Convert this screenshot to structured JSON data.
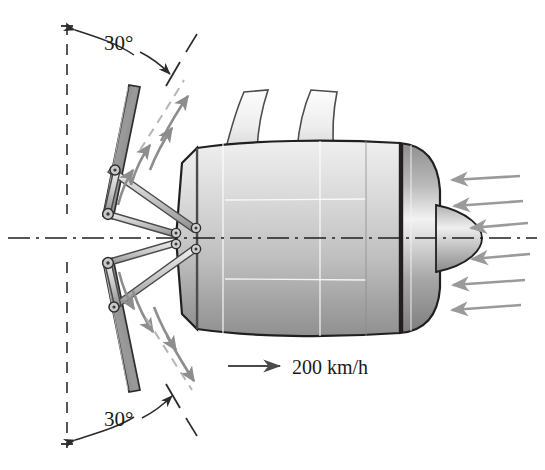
{
  "figure": {
    "type": "engineering-diagram",
    "width": 545,
    "height": 470,
    "background": "#ffffff"
  },
  "annotations": {
    "angle_top": "30°",
    "angle_bottom": "30°",
    "velocity": "200 km/h"
  },
  "colors": {
    "outline": "#231f20",
    "body_light": "#ececec",
    "body_mid": "#c4c4c4",
    "body_dark": "#8f8f8f",
    "bucket": "#8a8a8a",
    "bucket_edge": "#3a3a3a",
    "flow_arrow": "#8d8d8d",
    "inlet_arrow": "#9a9a9a",
    "dim_line": "#2b2b2b",
    "center_line": "#1f1f1f",
    "link": "#d0d0d0",
    "link_edge": "#4a4a4a"
  },
  "geometry": {
    "centerline_y": 238,
    "vertical_ref_x": 67,
    "reverser_angle_deg": 30,
    "pivot_upper": [
      105,
      212
    ],
    "pivot_lower": [
      105,
      265
    ],
    "inlet_arrow_count": 6,
    "flow_arrow_count_upper": 4,
    "flow_arrow_count_lower": 4
  },
  "elements": {
    "nacelle": "engine-nacelle-body",
    "pylon": "pylon-mount",
    "spinner": "nose-cone-spinner",
    "inlet_band": "fan-inlet-lip",
    "bucket_upper": "thrust-reverser-bucket-upper",
    "bucket_lower": "thrust-reverser-bucket-lower",
    "actuator_upper": "actuator-rod-upper",
    "actuator_lower": "actuator-rod-lower"
  }
}
